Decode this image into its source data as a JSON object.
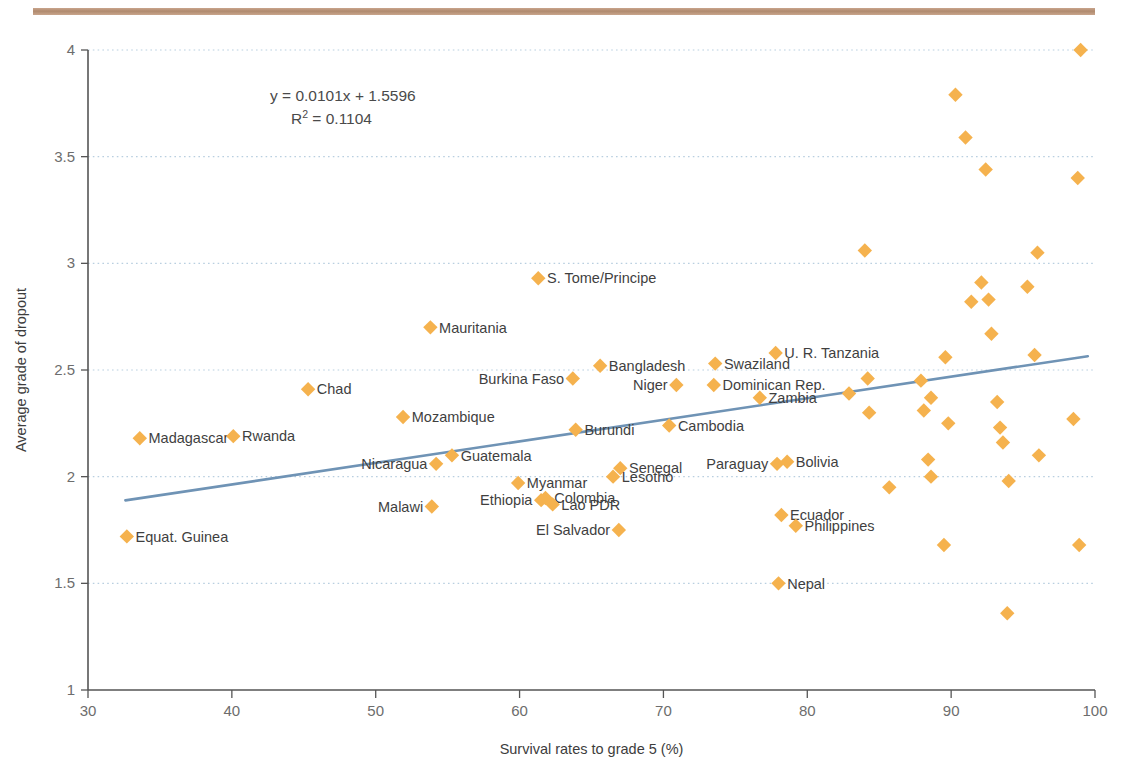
{
  "figure": {
    "top_rule_color": "#b08a6e",
    "marker_color": "#F5B24E",
    "trendline_color": "#6f93b5",
    "gridline_color": "#b9cfe0",
    "axis_color": "#555555"
  },
  "annotations": {
    "equation": "y = 0.0101x + 1.5596",
    "r_squared_prefix": "R",
    "r_squared_sup": "2",
    "r_squared_value": " = 0.1104"
  },
  "chart_data": {
    "type": "scatter",
    "title": "",
    "xlabel": "Survival rates to grade 5 (%)",
    "ylabel": "Average grade of dropout",
    "xlim": [
      30,
      100
    ],
    "ylim": [
      1,
      4
    ],
    "xticks": [
      30,
      40,
      50,
      60,
      70,
      80,
      90,
      100
    ],
    "yticks": [
      1,
      1.5,
      2,
      2.5,
      3,
      3.5,
      4
    ],
    "grid": "horizontal-dotted",
    "legend": "none",
    "trendline": {
      "slope": 0.0101,
      "intercept": 1.5596,
      "r_squared": 0.1104,
      "x_start": 32.6,
      "x_end": 99.5
    },
    "points": [
      {
        "label": "Equat. Guinea",
        "x": 32.7,
        "y": 1.72,
        "label_side": "right"
      },
      {
        "label": "Madagascar",
        "x": 33.6,
        "y": 2.18,
        "label_side": "right"
      },
      {
        "label": "Rwanda",
        "x": 40.1,
        "y": 2.19,
        "label_side": "right"
      },
      {
        "label": "Chad",
        "x": 45.3,
        "y": 2.41,
        "label_side": "right"
      },
      {
        "label": "Mozambique",
        "x": 51.9,
        "y": 2.28,
        "label_side": "right"
      },
      {
        "label": "Malawi",
        "x": 53.9,
        "y": 1.86,
        "label_side": "left"
      },
      {
        "label": "Mauritania",
        "x": 53.8,
        "y": 2.7,
        "label_side": "right"
      },
      {
        "label": "Nicaragua",
        "x": 54.2,
        "y": 2.06,
        "label_side": "left"
      },
      {
        "label": "Guatemala",
        "x": 55.3,
        "y": 2.1,
        "label_side": "right"
      },
      {
        "label": "Myanmar",
        "x": 59.9,
        "y": 1.97,
        "label_side": "right"
      },
      {
        "label": "Ethiopia",
        "x": 61.5,
        "y": 1.89,
        "label_side": "left"
      },
      {
        "label": "Colombia",
        "x": 61.8,
        "y": 1.9,
        "label_side": "right"
      },
      {
        "label": "S. Tome/Principe",
        "x": 61.3,
        "y": 2.93,
        "label_side": "right"
      },
      {
        "label": "Lao PDR",
        "x": 62.3,
        "y": 1.87,
        "label_side": "right"
      },
      {
        "label": "Burkina Faso",
        "x": 63.7,
        "y": 2.46,
        "label_side": "left"
      },
      {
        "label": "Burundi",
        "x": 63.9,
        "y": 2.22,
        "label_side": "right"
      },
      {
        "label": "Bangladesh",
        "x": 65.6,
        "y": 2.52,
        "label_side": "right"
      },
      {
        "label": "El Salvador",
        "x": 66.9,
        "y": 1.75,
        "label_side": "left"
      },
      {
        "label": "Senegal",
        "x": 67.0,
        "y": 2.04,
        "label_side": "right"
      },
      {
        "label": "Lesotho",
        "x": 66.5,
        "y": 2.0,
        "label_side": "right"
      },
      {
        "label": "Niger",
        "x": 70.9,
        "y": 2.43,
        "label_side": "left"
      },
      {
        "label": "Cambodia",
        "x": 70.4,
        "y": 2.24,
        "label_side": "right"
      },
      {
        "label": "Dominican Rep.",
        "x": 73.5,
        "y": 2.43,
        "label_side": "right"
      },
      {
        "label": "Swaziland",
        "x": 73.6,
        "y": 2.53,
        "label_side": "right"
      },
      {
        "label": "Paraguay",
        "x": 77.9,
        "y": 2.06,
        "label_side": "left"
      },
      {
        "label": "Bolivia",
        "x": 78.6,
        "y": 2.07,
        "label_side": "right"
      },
      {
        "label": "U. R. Tanzania",
        "x": 77.8,
        "y": 2.58,
        "label_side": "right"
      },
      {
        "label": "Zambia",
        "x": 76.7,
        "y": 2.37,
        "label_side": "right"
      },
      {
        "label": "Ecuador",
        "x": 78.2,
        "y": 1.82,
        "label_side": "right"
      },
      {
        "label": "Philippines",
        "x": 79.2,
        "y": 1.77,
        "label_side": "right"
      },
      {
        "label": "Nepal",
        "x": 78.0,
        "y": 1.5,
        "label_side": "right"
      },
      {
        "label": "",
        "x": 82.9,
        "y": 2.39,
        "label_side": "right"
      },
      {
        "label": "",
        "x": 84.0,
        "y": 3.06,
        "label_side": "right"
      },
      {
        "label": "",
        "x": 84.2,
        "y": 2.46,
        "label_side": "right"
      },
      {
        "label": "",
        "x": 84.3,
        "y": 2.3,
        "label_side": "right"
      },
      {
        "label": "",
        "x": 85.7,
        "y": 1.95,
        "label_side": "right"
      },
      {
        "label": "",
        "x": 87.9,
        "y": 2.45,
        "label_side": "right"
      },
      {
        "label": "",
        "x": 88.1,
        "y": 2.31,
        "label_side": "right"
      },
      {
        "label": "",
        "x": 88.4,
        "y": 2.08,
        "label_side": "right"
      },
      {
        "label": "",
        "x": 88.6,
        "y": 2.37,
        "label_side": "right"
      },
      {
        "label": "",
        "x": 88.6,
        "y": 2.0,
        "label_side": "right"
      },
      {
        "label": "",
        "x": 89.5,
        "y": 1.68,
        "label_side": "right"
      },
      {
        "label": "",
        "x": 89.6,
        "y": 2.56,
        "label_side": "right"
      },
      {
        "label": "",
        "x": 89.8,
        "y": 2.25,
        "label_side": "right"
      },
      {
        "label": "",
        "x": 90.3,
        "y": 3.79,
        "label_side": "right"
      },
      {
        "label": "",
        "x": 91.0,
        "y": 3.59,
        "label_side": "right"
      },
      {
        "label": "",
        "x": 91.4,
        "y": 2.82,
        "label_side": "right"
      },
      {
        "label": "",
        "x": 92.1,
        "y": 2.91,
        "label_side": "right"
      },
      {
        "label": "",
        "x": 92.4,
        "y": 3.44,
        "label_side": "right"
      },
      {
        "label": "",
        "x": 92.6,
        "y": 2.83,
        "label_side": "right"
      },
      {
        "label": "",
        "x": 92.8,
        "y": 2.67,
        "label_side": "right"
      },
      {
        "label": "",
        "x": 93.2,
        "y": 2.35,
        "label_side": "right"
      },
      {
        "label": "",
        "x": 93.4,
        "y": 2.23,
        "label_side": "right"
      },
      {
        "label": "",
        "x": 93.6,
        "y": 2.16,
        "label_side": "right"
      },
      {
        "label": "",
        "x": 93.9,
        "y": 1.36,
        "label_side": "right"
      },
      {
        "label": "",
        "x": 94.0,
        "y": 1.98,
        "label_side": "right"
      },
      {
        "label": "",
        "x": 95.3,
        "y": 2.89,
        "label_side": "right"
      },
      {
        "label": "",
        "x": 95.8,
        "y": 2.57,
        "label_side": "right"
      },
      {
        "label": "",
        "x": 96.0,
        "y": 3.05,
        "label_side": "right"
      },
      {
        "label": "",
        "x": 96.1,
        "y": 2.1,
        "label_side": "right"
      },
      {
        "label": "",
        "x": 98.5,
        "y": 2.27,
        "label_side": "right"
      },
      {
        "label": "",
        "x": 98.8,
        "y": 3.4,
        "label_side": "right"
      },
      {
        "label": "",
        "x": 98.9,
        "y": 1.68,
        "label_side": "right"
      },
      {
        "label": "",
        "x": 99.0,
        "y": 4.0,
        "label_side": "right"
      }
    ]
  }
}
